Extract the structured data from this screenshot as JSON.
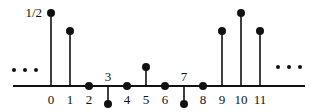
{
  "diagram": {
    "type": "stem_plot",
    "axis": {
      "y": 86,
      "x_start": 13,
      "x_end": 305,
      "color": "#111111"
    },
    "peak_label": "1/2",
    "ellipsis_left": "...",
    "ellipsis_right": "...",
    "samples": [
      {
        "n": "0",
        "x": 51,
        "y": 13,
        "label_pos": "below"
      },
      {
        "n": "1",
        "x": 70,
        "y": 31,
        "label_pos": "below"
      },
      {
        "n": "2",
        "x": 89,
        "y": 86,
        "label_pos": "below"
      },
      {
        "n": "3",
        "x": 108,
        "y": 104,
        "label_pos": "above"
      },
      {
        "n": "4",
        "x": 127,
        "y": 86,
        "label_pos": "below"
      },
      {
        "n": "5",
        "x": 146,
        "y": 67,
        "label_pos": "below"
      },
      {
        "n": "6",
        "x": 165,
        "y": 86,
        "label_pos": "below"
      },
      {
        "n": "7",
        "x": 184,
        "y": 104,
        "label_pos": "above"
      },
      {
        "n": "8",
        "x": 203,
        "y": 86,
        "label_pos": "below"
      },
      {
        "n": "9",
        "x": 222,
        "y": 31,
        "label_pos": "below"
      },
      {
        "n": "10",
        "x": 241,
        "y": 13,
        "label_pos": "below"
      },
      {
        "n": "11",
        "x": 260,
        "y": 31,
        "label_pos": "below"
      }
    ]
  }
}
